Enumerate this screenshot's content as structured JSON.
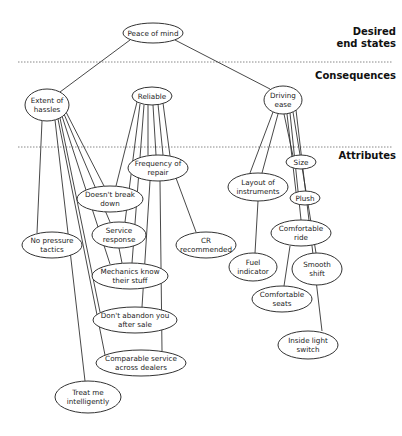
{
  "levels": [
    {
      "id": "desired",
      "label_line1": "Desired",
      "label_line2": "end states"
    },
    {
      "id": "consequences",
      "label_line1": "Consequences"
    },
    {
      "id": "attributes",
      "label_line1": "Attributes"
    }
  ],
  "nodes": {
    "peace": {
      "lines": [
        "Peace of mind"
      ],
      "cx": 153,
      "cy": 33,
      "rx": 30,
      "ry": 10
    },
    "hassles": {
      "lines": [
        "Extent of",
        "hassles"
      ],
      "cx": 47,
      "cy": 105,
      "rx": 22,
      "ry": 16
    },
    "reliable": {
      "lines": [
        "Reliable"
      ],
      "cx": 152,
      "cy": 96,
      "rx": 20,
      "ry": 9
    },
    "driving": {
      "lines": [
        "Driving",
        "ease"
      ],
      "cx": 283,
      "cy": 100,
      "rx": 19,
      "ry": 14
    },
    "frequency": {
      "lines": [
        "Frequency of",
        "repair"
      ],
      "cx": 158,
      "cy": 168,
      "rx": 30,
      "ry": 13
    },
    "doesnt_break": {
      "lines": [
        "Doesn't break",
        "down"
      ],
      "cx": 110,
      "cy": 199,
      "rx": 33,
      "ry": 13
    },
    "no_pressure": {
      "lines": [
        "No pressure",
        "tactics"
      ],
      "cx": 52,
      "cy": 245,
      "rx": 30,
      "ry": 13
    },
    "service_response": {
      "lines": [
        "Service",
        "response"
      ],
      "cx": 119,
      "cy": 235,
      "rx": 27,
      "ry": 13
    },
    "cr": {
      "lines": [
        "CR",
        "recommended"
      ],
      "cx": 206,
      "cy": 245,
      "rx": 30,
      "ry": 13
    },
    "mechanics": {
      "lines": [
        "Mechanics know",
        "their stuff"
      ],
      "cx": 130,
      "cy": 276,
      "rx": 38,
      "ry": 13
    },
    "dont_abandon": {
      "lines": [
        "Don't abandon you",
        "after sale"
      ],
      "cx": 135,
      "cy": 320,
      "rx": 42,
      "ry": 13
    },
    "comparable": {
      "lines": [
        "Comparable service",
        "across dealers"
      ],
      "cx": 141,
      "cy": 363,
      "rx": 45,
      "ry": 13
    },
    "treat_me": {
      "lines": [
        "Treat me",
        "intelligently"
      ],
      "cx": 88,
      "cy": 397,
      "rx": 33,
      "ry": 16
    },
    "layout": {
      "lines": [
        "Layout of",
        "instruments"
      ],
      "cx": 258,
      "cy": 187,
      "rx": 30,
      "ry": 14
    },
    "size": {
      "lines": [
        "Size"
      ],
      "cx": 301,
      "cy": 162,
      "rx": 15,
      "ry": 7
    },
    "plush": {
      "lines": [
        "Plush"
      ],
      "cx": 305,
      "cy": 198,
      "rx": 15,
      "ry": 7
    },
    "comfortable_ride": {
      "lines": [
        "Comfortable",
        "ride"
      ],
      "cx": 301,
      "cy": 233,
      "rx": 30,
      "ry": 13
    },
    "fuel": {
      "lines": [
        "Fuel",
        "indicator"
      ],
      "cx": 253,
      "cy": 267,
      "rx": 24,
      "ry": 14
    },
    "smooth_shift": {
      "lines": [
        "Smooth",
        "shift"
      ],
      "cx": 317,
      "cy": 269,
      "rx": 25,
      "ry": 16
    },
    "comfortable_seats": {
      "lines": [
        "Comfortable",
        "seats"
      ],
      "cx": 282,
      "cy": 299,
      "rx": 30,
      "ry": 13
    },
    "inside_light": {
      "lines": [
        "Inside light",
        "switch"
      ],
      "cx": 308,
      "cy": 345,
      "rx": 30,
      "ry": 14
    }
  },
  "node_order": [
    "peace",
    "hassles",
    "reliable",
    "driving",
    "frequency",
    "doesnt_break",
    "no_pressure",
    "service_response",
    "cr",
    "mechanics",
    "dont_abandon",
    "comparable",
    "treat_me",
    "layout",
    "size",
    "plush",
    "comfortable_ride",
    "fuel",
    "smooth_shift",
    "comfortable_seats",
    "inside_light"
  ],
  "edges": [
    {
      "from": "peace",
      "to": "hassles",
      "x1": 130,
      "y1": 40,
      "x2": 60,
      "y2": 92
    },
    {
      "from": "peace",
      "to": "driving",
      "x1": 175,
      "y1": 40,
      "x2": 270,
      "y2": 89
    },
    {
      "from": "hassles",
      "to": "no_pressure",
      "x1": 42,
      "y1": 121,
      "x2": 37,
      "y2": 233
    },
    {
      "from": "hassles",
      "to": "treat_me",
      "x1": 55,
      "y1": 120,
      "x2": 85,
      "y2": 381
    },
    {
      "from": "hassles",
      "to": "comparable",
      "x1": 58,
      "y1": 119,
      "x2": 105,
      "y2": 355
    },
    {
      "from": "hassles",
      "to": "dont_abandon",
      "x1": 60,
      "y1": 118,
      "x2": 100,
      "y2": 312
    },
    {
      "from": "hassles",
      "to": "mechanics",
      "x1": 62,
      "y1": 116,
      "x2": 110,
      "y2": 264
    },
    {
      "from": "hassles",
      "to": "service_response",
      "x1": 64,
      "y1": 114,
      "x2": 110,
      "y2": 222
    },
    {
      "from": "hassles",
      "to": "doesnt_break",
      "x1": 66,
      "y1": 112,
      "x2": 104,
      "y2": 186
    },
    {
      "from": "reliable",
      "to": "doesnt_break",
      "x1": 137,
      "y1": 102,
      "x2": 116,
      "y2": 186
    },
    {
      "from": "reliable",
      "to": "service_response",
      "x1": 140,
      "y1": 104,
      "x2": 125,
      "y2": 222
    },
    {
      "from": "reliable",
      "to": "mechanics",
      "x1": 144,
      "y1": 105,
      "x2": 132,
      "y2": 263
    },
    {
      "from": "reliable",
      "to": "frequency",
      "x1": 148,
      "y1": 105,
      "x2": 148,
      "y2": 155
    },
    {
      "from": "reliable",
      "to": "frequency",
      "x1": 153,
      "y1": 105,
      "x2": 156,
      "y2": 155
    },
    {
      "from": "reliable",
      "to": "frequency",
      "x1": 158,
      "y1": 104,
      "x2": 163,
      "y2": 155
    },
    {
      "from": "reliable",
      "to": "frequency",
      "x1": 163,
      "y1": 103,
      "x2": 170,
      "y2": 156
    },
    {
      "from": "frequency",
      "to": "cr",
      "x1": 176,
      "y1": 178,
      "x2": 196,
      "y2": 232
    },
    {
      "from": "frequency",
      "to": "dont_abandon",
      "x1": 150,
      "y1": 181,
      "x2": 142,
      "y2": 307
    },
    {
      "from": "frequency",
      "to": "comparable",
      "x1": 160,
      "y1": 181,
      "x2": 162,
      "y2": 351
    },
    {
      "from": "service_response",
      "to": "mechanics",
      "x1": 119,
      "y1": 248,
      "x2": 122,
      "y2": 263
    },
    {
      "from": "driving",
      "to": "layout",
      "x1": 273,
      "y1": 112,
      "x2": 250,
      "y2": 173
    },
    {
      "from": "driving",
      "to": "layout",
      "x1": 278,
      "y1": 114,
      "x2": 262,
      "y2": 173
    },
    {
      "from": "driving",
      "to": "size",
      "x1": 284,
      "y1": 114,
      "x2": 293,
      "y2": 156
    },
    {
      "from": "driving",
      "to": "plush",
      "x1": 287,
      "y1": 114,
      "x2": 296,
      "y2": 192
    },
    {
      "from": "driving",
      "to": "comfortable_ride",
      "x1": 290,
      "y1": 113,
      "x2": 301,
      "y2": 220
    },
    {
      "from": "driving",
      "to": "smooth_shift",
      "x1": 293,
      "y1": 112,
      "x2": 316,
      "y2": 253
    },
    {
      "from": "driving",
      "to": "inside_light",
      "x1": 296,
      "y1": 110,
      "x2": 322,
      "y2": 331
    },
    {
      "from": "layout",
      "to": "fuel",
      "x1": 258,
      "y1": 201,
      "x2": 255,
      "y2": 253
    },
    {
      "from": "comfortable_ride",
      "to": "comfortable_seats",
      "x1": 290,
      "y1": 246,
      "x2": 284,
      "y2": 286
    }
  ],
  "dividers": [
    {
      "y": 62,
      "x1": 18,
      "x2": 392
    },
    {
      "y": 147,
      "x1": 18,
      "x2": 392
    }
  ],
  "colors": {
    "line": "#333333",
    "divider": "#888888",
    "text": "#222222",
    "background": "#ffffff"
  }
}
